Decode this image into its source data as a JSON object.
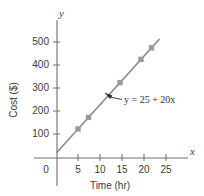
{
  "chart_data": {
    "type": "line",
    "title": "",
    "subtitle": "",
    "xlabel": "Time (hr)",
    "ylabel": "Cost ($)",
    "x_axis_variable": "x",
    "y_axis_variable": "y",
    "xlim": [
      0,
      27
    ],
    "ylim": [
      0,
      560
    ],
    "xticks": [
      0,
      5,
      10,
      15,
      20,
      25
    ],
    "xtick_labels": [
      "0",
      "5",
      "10",
      "15",
      "20",
      "25"
    ],
    "yticks": [
      100,
      200,
      300,
      400,
      500
    ],
    "ytick_labels": [
      "100",
      "200",
      "300",
      "400",
      "500"
    ],
    "grid": false,
    "legend": "none",
    "origin_label": "0",
    "annotations": [
      {
        "name": "line-equation",
        "text": "y = 25 + 20x",
        "equation_lhs": "y",
        "equation_rhs": "25 + 20x",
        "intercept": 25,
        "slope": 20,
        "points_to_x": 11.6,
        "points_to_y": 257
      }
    ],
    "series": [
      {
        "name": "Cost",
        "color": "#8a8a8a",
        "marker": "square",
        "marker_color": "#9a9a9a",
        "line_from": {
          "x": 0,
          "y": 25
        },
        "line_to": {
          "x": 24.3,
          "y": 511
        },
        "points": [
          {
            "x": 5,
            "y": 125
          },
          {
            "x": 7.5,
            "y": 175
          },
          {
            "x": 15,
            "y": 325
          },
          {
            "x": 20,
            "y": 425
          },
          {
            "x": 22.5,
            "y": 475
          }
        ]
      }
    ]
  },
  "colors": {
    "axis": "#6e6e6e",
    "line": "#8a8a8a",
    "marker": "#9a9a9a",
    "text": "#3b3b3b",
    "background": "#ffffff"
  }
}
